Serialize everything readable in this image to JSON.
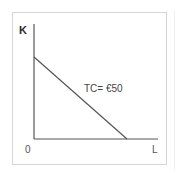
{
  "figure": {
    "y_axis_label": "K",
    "x_axis_label": "L",
    "origin_label": "0",
    "line_label": "TC= €50",
    "line_color": "#555555",
    "axis_color": "#555555",
    "frame_color": "#d6d6d6"
  },
  "geometry": {
    "y_axis": {
      "x": 34,
      "y_top": 24,
      "y_bottom": 139
    },
    "x_axis": {
      "y": 139,
      "x_left": 34,
      "x_right": 158
    },
    "isocost_line": {
      "x1": 34,
      "y1": 57,
      "x2": 127,
      "y2": 139
    }
  }
}
